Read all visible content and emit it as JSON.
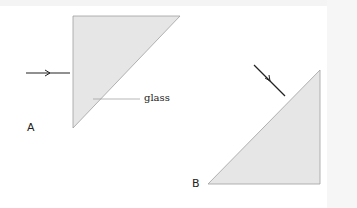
{
  "diagram": {
    "panels": [
      {
        "label": "A",
        "shape": "right-triangle",
        "arrow": "horizontal incident ray from left onto vertical face"
      },
      {
        "label": "B",
        "shape": "right-triangle",
        "arrow": "diagonal incident ray onto hypotenuse"
      }
    ],
    "annotation": "glass",
    "colors": {
      "glass_fill": "#e6e6e6",
      "outline": "#9a9a9a",
      "arrow": "#222222"
    }
  }
}
